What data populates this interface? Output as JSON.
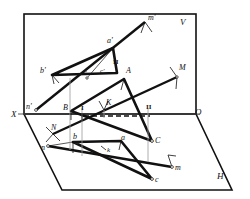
{
  "figure": {
    "type": "descriptive-geometry-projection",
    "background_color": "#ffffff",
    "ink_color": "#111111",
    "planes": {
      "vertical": {
        "label": "V",
        "shape": "rectangle"
      },
      "horizontal": {
        "label": "H",
        "shape": "parallelogram"
      }
    },
    "axis": {
      "name": "ground-line",
      "left_label": "X",
      "right_label": "O"
    }
  },
  "labels": {
    "plane_v": "V",
    "plane_h": "H",
    "axis_x": "X",
    "axis_o": "O",
    "a_prime": "a'",
    "b_prime": "b'",
    "c_prime": "c'",
    "k_prime": "k'",
    "m_prime": "m'",
    "n_prime": "n'",
    "a_small": "a",
    "b_small": "b",
    "c_small": "c",
    "k_small": "k",
    "m_small": "m",
    "n_small": "n",
    "A_cap": "A",
    "B_cap": "B",
    "C_cap": "C",
    "K_cap": "K",
    "M_cap": "M",
    "N_cap": "N",
    "roman_one": "I",
    "roman_two_axis": "II",
    "roman_two_upper": "II"
  },
  "points": {
    "a_prime": {
      "x": 113,
      "y": 48
    },
    "b_prime": {
      "x": 52,
      "y": 75
    },
    "c_prime": {
      "x": 117,
      "y": 73
    },
    "k_prime": {
      "x": 87,
      "y": 78
    },
    "m_prime": {
      "x": 145,
      "y": 22
    },
    "n_prime": {
      "x": 36,
      "y": 110
    },
    "A_cap": {
      "x": 124,
      "y": 79
    },
    "B_cap": {
      "x": 71,
      "y": 111
    },
    "C_cap": {
      "x": 152,
      "y": 141
    },
    "K_cap": {
      "x": 104,
      "y": 110
    },
    "M_cap": {
      "x": 177,
      "y": 77
    },
    "N_cap": {
      "x": 53,
      "y": 134
    },
    "a_small": {
      "x": 121,
      "y": 141
    },
    "b_small": {
      "x": 73,
      "y": 142
    },
    "c_small": {
      "x": 152,
      "y": 179
    },
    "k_small": {
      "x": 106,
      "y": 150
    },
    "m_small": {
      "x": 172,
      "y": 167
    },
    "n_small": {
      "x": 48,
      "y": 146
    },
    "axis_I": {
      "x": 82,
      "y": 113
    },
    "axis_II": {
      "x": 148,
      "y": 113
    }
  },
  "annotations": {
    "dashed_line": "projection-connector",
    "vertical_projectors": "point-correspondence-lines"
  }
}
